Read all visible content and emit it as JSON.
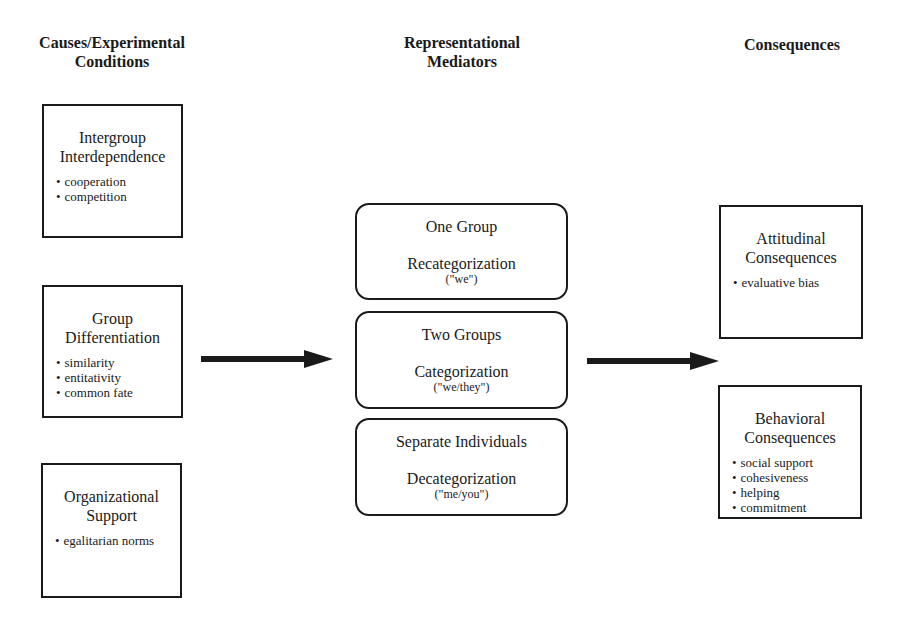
{
  "headers": {
    "causes": [
      "Causes/Experimental",
      "Conditions"
    ],
    "mediators": [
      "Representational",
      "Mediators"
    ],
    "consequences": [
      "Consequences"
    ]
  },
  "causes": [
    {
      "title": [
        "Intergroup",
        "Interdependence"
      ],
      "items": [
        "cooperation",
        "competition"
      ]
    },
    {
      "title": [
        "Group",
        "Differentiation"
      ],
      "items": [
        "similarity",
        "entitativity",
        "common fate"
      ]
    },
    {
      "title": [
        "Organizational",
        "Support"
      ],
      "items": [
        "egalitarian norms"
      ]
    }
  ],
  "mediators": [
    {
      "label": "One Group",
      "process": "Recategorization",
      "pronoun": "(\"we\")"
    },
    {
      "label": "Two Groups",
      "process": "Categorization",
      "pronoun": "(\"we/they\")"
    },
    {
      "label": "Separate Individuals",
      "process": "Decategorization",
      "pronoun": "(\"me/you\")"
    }
  ],
  "consequences": [
    {
      "title": [
        "Attitudinal",
        "Consequences"
      ],
      "items": [
        "evaluative bias"
      ]
    },
    {
      "title": [
        "Behavioral",
        "Consequences"
      ],
      "items": [
        "social support",
        "cohesiveness",
        "helping",
        "commitment"
      ]
    }
  ],
  "colors": {
    "ink": "#1a1a1a",
    "background": "#ffffff"
  }
}
